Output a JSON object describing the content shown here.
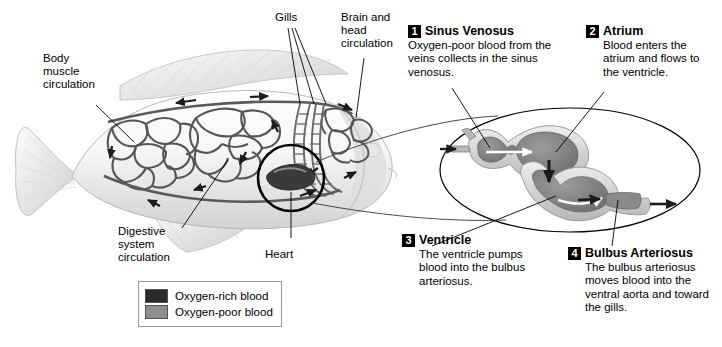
{
  "figure": {
    "background": "#ffffff"
  },
  "fish_labels": [
    {
      "id": "body-muscle-circulation",
      "text": "Body\nmuscle\ncirculation"
    },
    {
      "id": "gills",
      "text": "Gills"
    },
    {
      "id": "brain-and-head-circulation",
      "text": "Brain and\nhead\ncirculation"
    },
    {
      "id": "digestive-system-circulation",
      "text": "Digestive\nsystem\ncirculation"
    },
    {
      "id": "heart",
      "text": "Heart"
    }
  ],
  "callouts": [
    {
      "number": "1",
      "title": "Sinus Venosus",
      "body": "Oxygen-poor blood from the veins collects in the sinus venosus."
    },
    {
      "number": "2",
      "title": "Atrium",
      "body": "Blood enters the atrium and flows to the ventricle."
    },
    {
      "number": "3",
      "title": "Ventricle",
      "body": "The ventricle pumps blood into the bulbus arteriosus."
    },
    {
      "number": "4",
      "title": "Bulbus Arteriosus",
      "body": "The bulbus arteriosus moves blood into the ventral aorta and toward the gills."
    }
  ],
  "legend": {
    "items": [
      {
        "label": "Oxygen-rich blood",
        "color": "#2b2b2b"
      },
      {
        "label": "Oxygen-poor blood",
        "color": "#8d8d8d"
      }
    ]
  },
  "colors": {
    "oxygen_rich": "#2b2b2b",
    "oxygen_poor": "#8d8d8d",
    "fish_body_light": "#f2f2f2",
    "fish_shade": "#c9c9c9",
    "vessel_outline": "#4a4a4a",
    "outline": "#000000",
    "badge_bg": "#000000",
    "badge_fg": "#ffffff"
  }
}
